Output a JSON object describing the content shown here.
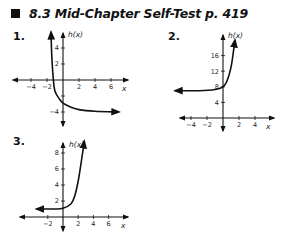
{
  "header": {
    "section": "8.3",
    "title": "Mid-Chapter Self-Test",
    "page": "p. 419",
    "full_title": "8.3  Mid-Chapter Self-Test  p. 419"
  },
  "problems": [
    {
      "number": "1."
    },
    {
      "number": "2."
    },
    {
      "number": "3."
    }
  ],
  "chart_data": [
    {
      "type": "line",
      "title": "1.",
      "xlabel": "x",
      "ylabel": "h(x)",
      "x_ticks": [
        -4,
        -2,
        2,
        4,
        6
      ],
      "y_ticks": [
        -4,
        2,
        4
      ],
      "y_ticks_all": [
        -4,
        -2,
        2,
        4
      ],
      "xlim": [
        -5.5,
        7.5
      ],
      "ylim": [
        -5,
        6
      ],
      "asymptote": {
        "type": "horizontal",
        "y": -4
      },
      "y_intercept": -3,
      "description": "Decreasing exponential-type curve, steep near x=-1.5, approaching y=-4 as x increases",
      "points": [
        [
          -1.5,
          6
        ],
        [
          -1.4,
          3
        ],
        [
          -1.2,
          0
        ],
        [
          -1,
          -1.4
        ],
        [
          -0.5,
          -2.3
        ],
        [
          0,
          -2.9
        ],
        [
          1,
          -3.4
        ],
        [
          2,
          -3.7
        ],
        [
          4,
          -3.9
        ],
        [
          7,
          -4
        ]
      ]
    },
    {
      "type": "line",
      "title": "2.",
      "xlabel": "x",
      "ylabel": "h(x)",
      "x_ticks": [
        -4,
        -2,
        2,
        4
      ],
      "y_ticks": [
        4,
        8,
        12,
        16
      ],
      "xlim": [
        -5.5,
        5.5
      ],
      "ylim": [
        -2,
        20
      ],
      "asymptote": {
        "type": "horizontal",
        "y": 7
      },
      "y_intercept": 8,
      "description": "Increasing exponential curve approaching y=7 as x decreases, rising steeply for x>0",
      "points": [
        [
          -6,
          7
        ],
        [
          -3,
          7
        ],
        [
          -1,
          7.3
        ],
        [
          0,
          8
        ],
        [
          0.5,
          9.5
        ],
        [
          1,
          13
        ],
        [
          1.3,
          17
        ],
        [
          1.5,
          20
        ]
      ]
    },
    {
      "type": "line",
      "title": "3.",
      "xlabel": "x",
      "ylabel": "h(x)",
      "x_ticks": [
        -2,
        2,
        4,
        6
      ],
      "y_ticks": [
        2,
        4,
        6,
        8
      ],
      "xlim": [
        -3.5,
        7.5
      ],
      "ylim": [
        -1,
        9.5
      ],
      "asymptote": {
        "type": "horizontal",
        "y": 1
      },
      "y_intercept": 1,
      "description": "Increasing exponential curve approaching y=1 as x decreases, rising steeply for x>1.5",
      "points": [
        [
          -3.5,
          1
        ],
        [
          -1,
          1
        ],
        [
          0,
          1.1
        ],
        [
          1,
          1.6
        ],
        [
          1.5,
          2.5
        ],
        [
          2,
          4.5
        ],
        [
          2.5,
          7.5
        ],
        [
          2.8,
          9.5
        ]
      ]
    }
  ]
}
